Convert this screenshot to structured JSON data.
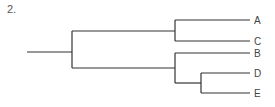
{
  "figure_label": "2.",
  "tree": {
    "root": {
      "children": [
        {
          "children": [
            {
              "leaf": "A"
            },
            {
              "leaf": "C"
            }
          ]
        },
        {
          "children": [
            {
              "leaf": "B"
            },
            {
              "children": [
                {
                  "leaf": "D"
                },
                {
                  "leaf": "E"
                }
              ]
            }
          ]
        }
      ]
    }
  },
  "leaves": [
    "A",
    "C",
    "B",
    "D",
    "E"
  ]
}
